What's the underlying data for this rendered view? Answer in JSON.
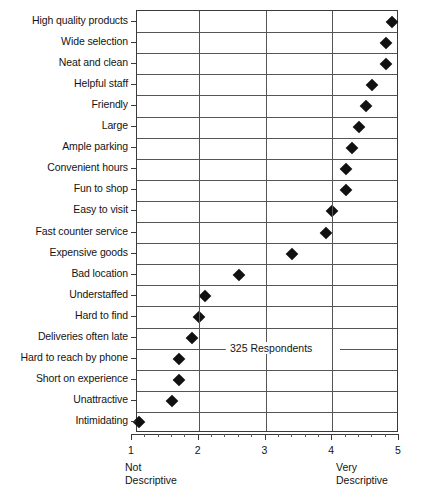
{
  "chart_data": {
    "type": "scatter",
    "orientation": "horizontal",
    "title": "",
    "subtitle": "",
    "xlabel": "",
    "ylabel": "",
    "xlim": [
      1,
      5
    ],
    "grid": true,
    "legend": null,
    "marker": "diamond",
    "marker_color": "#111111",
    "annotation": "325 Respondents",
    "axis_low_label_line1": "Not",
    "axis_low_label_line2": "Descriptive",
    "axis_high_label_line1": "Very",
    "axis_high_label_line2": "Descriptive",
    "xticks": [
      1,
      2,
      3,
      4,
      5
    ],
    "xtick_labels": [
      "1",
      "2",
      "3",
      "4",
      "5"
    ],
    "categories": [
      "High quality products",
      "Wide selection",
      "Neat and clean",
      "Helpful staff",
      "Friendly",
      "Large",
      "Ample parking",
      "Convenient hours",
      "Fun to shop",
      "Easy to visit",
      "Fast counter service",
      "Expensive goods",
      "Bad location",
      "Understaffed",
      "Hard to find",
      "Deliveries often late",
      "Hard to reach by phone",
      "Short on experience",
      "Unattractive",
      "Intimidating"
    ],
    "values": [
      4.9,
      4.8,
      4.8,
      4.6,
      4.5,
      4.4,
      4.3,
      4.2,
      4.2,
      4.0,
      3.9,
      3.4,
      2.6,
      2.1,
      2.0,
      1.9,
      1.7,
      1.7,
      1.6,
      1.1
    ]
  }
}
